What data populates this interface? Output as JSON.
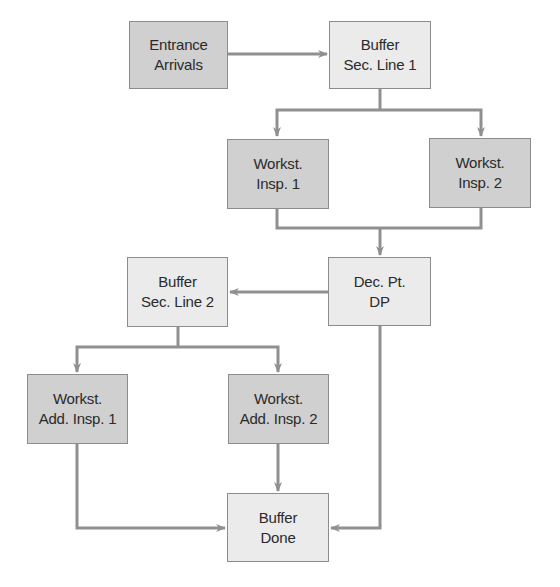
{
  "diagram": {
    "type": "flowchart",
    "colors": {
      "dark_fill": "#d0d0d0",
      "light_fill": "#ebebeb",
      "border": "#8c8c8c",
      "connector": "#909090",
      "text": "#2a2a2a"
    },
    "nodes": {
      "entrance": {
        "line1": "Entrance",
        "line2": "Arrivals",
        "style": "dark"
      },
      "buffer1": {
        "line1": "Buffer",
        "line2": "Sec. Line 1",
        "style": "light"
      },
      "insp1": {
        "line1": "Workst.",
        "line2": "Insp. 1",
        "style": "dark"
      },
      "insp2": {
        "line1": "Workst.",
        "line2": "Insp. 2",
        "style": "dark"
      },
      "decision": {
        "line1": "Dec. Pt.",
        "line2": "DP",
        "style": "light"
      },
      "buffer2": {
        "line1": "Buffer",
        "line2": "Sec. Line 2",
        "style": "light"
      },
      "addinsp1": {
        "line1": "Workst.",
        "line2": "Add. Insp. 1",
        "style": "dark"
      },
      "addinsp2": {
        "line1": "Workst.",
        "line2": "Add. Insp. 2",
        "style": "dark"
      },
      "done": {
        "line1": "Buffer",
        "line2": "Done",
        "style": "light"
      }
    },
    "edges": [
      {
        "from": "Entrance Arrivals",
        "to": "Buffer Sec. Line 1"
      },
      {
        "from": "Buffer Sec. Line 1",
        "to": "Workst. Insp. 1"
      },
      {
        "from": "Buffer Sec. Line 1",
        "to": "Workst. Insp. 2"
      },
      {
        "from": "Workst. Insp. 1",
        "to": "Dec. Pt. DP"
      },
      {
        "from": "Workst. Insp. 2",
        "to": "Dec. Pt. DP"
      },
      {
        "from": "Dec. Pt. DP",
        "to": "Buffer Sec. Line 2"
      },
      {
        "from": "Dec. Pt. DP",
        "to": "Buffer Done"
      },
      {
        "from": "Buffer Sec. Line 2",
        "to": "Workst. Add. Insp. 1"
      },
      {
        "from": "Buffer Sec. Line 2",
        "to": "Workst. Add. Insp. 2"
      },
      {
        "from": "Workst. Add. Insp. 1",
        "to": "Buffer Done"
      },
      {
        "from": "Workst. Add. Insp. 2",
        "to": "Buffer Done"
      }
    ]
  }
}
